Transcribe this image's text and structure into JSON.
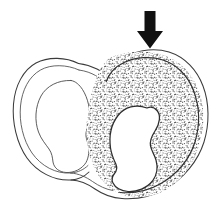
{
  "figure": {
    "title": "Cross-section diagram of a two-lobed structure",
    "background_color": "#ffffff",
    "canvas": {
      "width": 217,
      "height": 216
    },
    "annotation_arrow": {
      "icon": "down-arrow-icon",
      "label": "",
      "color": "#111111",
      "direction": "down",
      "points_at": "right-lobe-upper-wall",
      "tip": {
        "x": 150,
        "y": 48
      },
      "tail": {
        "x": 150,
        "y": 11
      }
    },
    "parts": [
      {
        "id": "left-lobe",
        "name": "Left lobe",
        "label": "",
        "fill": "none",
        "wall_texture": "plain",
        "stroke_color": "#3b3b3b",
        "has_outer_rim_line": true,
        "has_inner_cavity": true
      },
      {
        "id": "right-lobe",
        "name": "Right lobe",
        "label": "",
        "fill": "stipple",
        "wall_texture": "stippled",
        "stroke_color": "#2e2e2e",
        "stipple_color": "#555555",
        "has_outer_rim_line": true,
        "has_inner_cavity": true
      },
      {
        "id": "isthmus",
        "name": "Connecting isthmus",
        "label": "",
        "fill": "none",
        "wall_texture": "plain",
        "stroke_color": "#3b3b3b"
      },
      {
        "id": "left-cavity",
        "name": "Left lobe cavity",
        "label": "",
        "fill": "#ffffff",
        "stroke_color": "#4a4a4a"
      },
      {
        "id": "right-cavity",
        "name": "Right lobe cavity",
        "label": "",
        "fill": "#ffffff",
        "stroke_color": "#2e2e2e"
      }
    ],
    "stipple": {
      "dot_color": "#555555",
      "dot_size": 0.85,
      "density": "fine",
      "seed": 7
    }
  }
}
